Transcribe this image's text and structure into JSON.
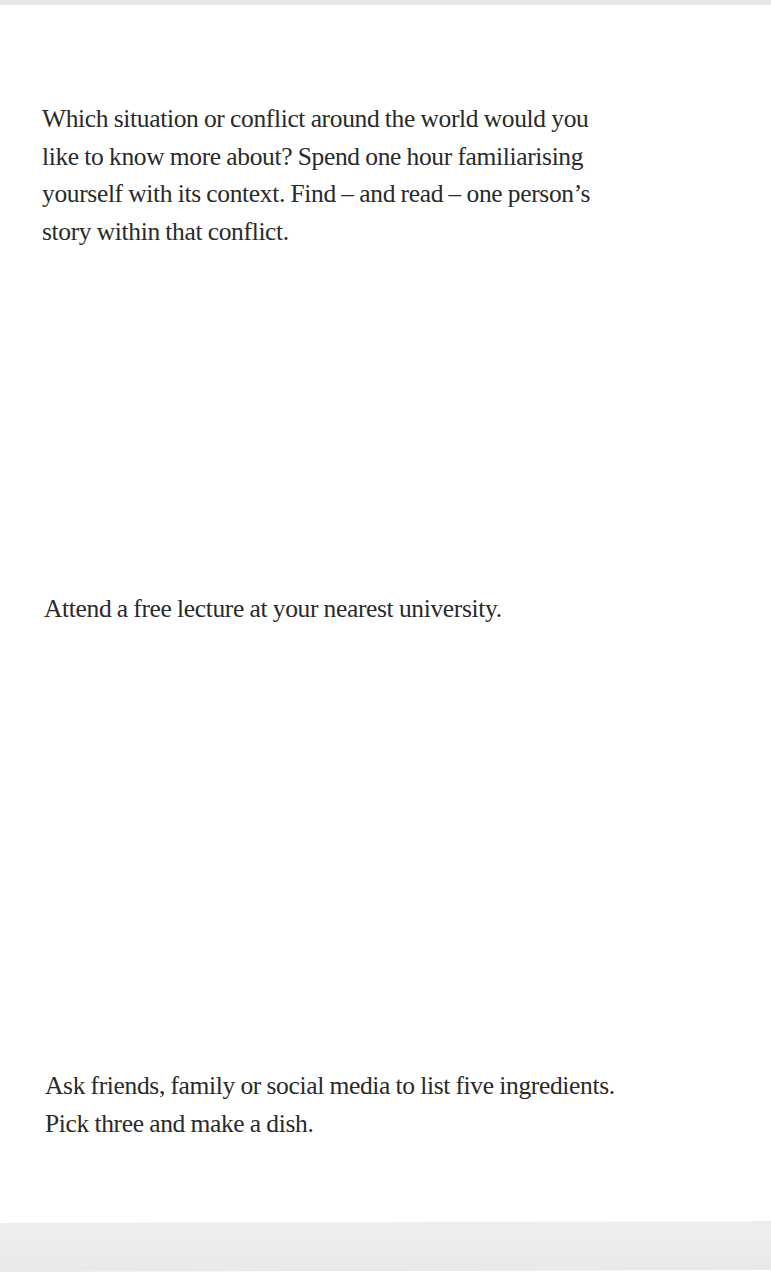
{
  "page": {
    "background_color": "#ffffff",
    "text_color": "#2a2a2a",
    "edge_color": "#e9e9e9"
  },
  "prompts": [
    {
      "text": "Which situation or conflict around the world would you like to know more about? Spend one hour familiarising yourself with its context. Find – and read – one person’s story within that conflict.",
      "lines": [
        "Which situation or conflict around the world would you",
        "like to know more about? Spend one hour familiarising",
        "yourself with its context. Find – and read – one person’s",
        "story within that conflict."
      ]
    },
    {
      "text": "Attend a free lecture at your nearest university.",
      "lines": [
        "Attend a free lecture at your nearest university."
      ]
    },
    {
      "text": "Ask friends, family or social media to list five ingredients. Pick three and make a dish.",
      "lines": [
        "Ask friends, family or social media to list five ingredients.",
        "Pick three and make a dish."
      ]
    }
  ]
}
